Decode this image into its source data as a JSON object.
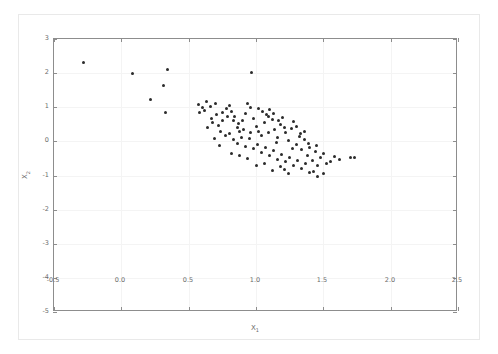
{
  "chart_data": {
    "type": "scatter",
    "title": "",
    "xlabel": "X1",
    "ylabel": "X2",
    "xlabel_base": "X",
    "xlabel_sub": "1",
    "ylabel_base": "X",
    "ylabel_sub": "2",
    "xlim": [
      -0.5,
      2.5
    ],
    "ylim": [
      -5,
      3
    ],
    "xticks": [
      -0.5,
      0.0,
      0.5,
      1.0,
      1.5,
      2.0,
      2.5
    ],
    "xticklabels": [
      "-0.5",
      "0.0",
      "0.5",
      "1.0",
      "1.5",
      "2.0",
      "2.5"
    ],
    "yticks": [
      -5,
      -4,
      -3,
      -2,
      -1,
      0,
      1,
      2,
      3
    ],
    "yticklabels": [
      "-5",
      "-4",
      "-3",
      "-2",
      "-1",
      "0",
      "1",
      "2",
      "3"
    ],
    "grid": true,
    "legend": null,
    "marker": "circle",
    "marker_color": "#2b2b2b",
    "marker_size": 3,
    "n_points": 118,
    "points": [
      [
        -0.28,
        2.3
      ],
      [
        0.08,
        1.99
      ],
      [
        0.34,
        2.11
      ],
      [
        0.31,
        1.64
      ],
      [
        0.22,
        1.22
      ],
      [
        0.33,
        0.86
      ],
      [
        0.97,
        2.03
      ],
      [
        0.63,
        1.16
      ],
      [
        0.57,
        1.07
      ],
      [
        0.6,
        0.99
      ],
      [
        0.62,
        0.9
      ],
      [
        0.58,
        0.84
      ],
      [
        0.66,
        1.02
      ],
      [
        0.7,
        1.12
      ],
      [
        0.68,
        0.55
      ],
      [
        0.72,
        0.47
      ],
      [
        0.75,
        0.62
      ],
      [
        0.78,
        0.95
      ],
      [
        0.8,
        1.05
      ],
      [
        0.82,
        0.88
      ],
      [
        0.84,
        0.72
      ],
      [
        0.86,
        0.4
      ],
      [
        0.88,
        0.28
      ],
      [
        0.9,
        0.6
      ],
      [
        0.92,
        0.82
      ],
      [
        0.94,
        1.12
      ],
      [
        0.96,
        0.98
      ],
      [
        0.98,
        0.66
      ],
      [
        1.0,
        0.45
      ],
      [
        1.02,
        0.3
      ],
      [
        1.04,
        0.18
      ],
      [
        1.06,
        0.55
      ],
      [
        1.08,
        0.78
      ],
      [
        1.1,
        0.92
      ],
      [
        1.12,
        0.63
      ],
      [
        1.14,
        0.35
      ],
      [
        1.16,
        0.1
      ],
      [
        1.18,
        0.48
      ],
      [
        1.2,
        0.7
      ],
      [
        1.22,
        0.25
      ],
      [
        1.24,
        0.02
      ],
      [
        1.26,
        0.38
      ],
      [
        1.28,
        0.58
      ],
      [
        1.3,
        -0.1
      ],
      [
        1.32,
        0.15
      ],
      [
        1.34,
        -0.25
      ],
      [
        1.36,
        0.05
      ],
      [
        1.38,
        -0.4
      ],
      [
        1.4,
        -0.18
      ],
      [
        1.42,
        -0.55
      ],
      [
        1.44,
        -0.3
      ],
      [
        1.46,
        -0.72
      ],
      [
        1.48,
        -0.48
      ],
      [
        1.5,
        -0.95
      ],
      [
        1.52,
        -0.66
      ],
      [
        1.46,
        -1.02
      ],
      [
        1.43,
        -0.88
      ],
      [
        1.55,
        -0.58
      ],
      [
        1.58,
        -0.45
      ],
      [
        1.62,
        -0.52
      ],
      [
        1.7,
        -0.48
      ],
      [
        1.73,
        -0.47
      ],
      [
        0.74,
        0.3
      ],
      [
        0.77,
        0.18
      ],
      [
        0.8,
        0.22
      ],
      [
        0.83,
        0.05
      ],
      [
        0.86,
        -0.05
      ],
      [
        0.89,
        0.12
      ],
      [
        0.92,
        -0.15
      ],
      [
        0.95,
        0.08
      ],
      [
        0.98,
        -0.22
      ],
      [
        1.01,
        -0.08
      ],
      [
        1.04,
        -0.32
      ],
      [
        1.07,
        -0.18
      ],
      [
        1.1,
        -0.42
      ],
      [
        1.13,
        -0.28
      ],
      [
        1.16,
        -0.52
      ],
      [
        1.19,
        -0.38
      ],
      [
        1.22,
        -0.6
      ],
      [
        1.25,
        -0.46
      ],
      [
        1.28,
        -0.7
      ],
      [
        1.31,
        -0.56
      ],
      [
        1.34,
        -0.8
      ],
      [
        1.37,
        -0.64
      ],
      [
        1.4,
        -0.9
      ],
      [
        1.24,
        -0.95
      ],
      [
        1.21,
        -0.82
      ],
      [
        1.18,
        -0.74
      ],
      [
        1.12,
        -0.86
      ],
      [
        1.06,
        -0.64
      ],
      [
        1.0,
        -0.72
      ],
      [
        0.94,
        -0.5
      ],
      [
        0.88,
        -0.42
      ],
      [
        0.82,
        -0.35
      ],
      [
        0.91,
        0.35
      ],
      [
        0.87,
        0.52
      ],
      [
        0.83,
        0.62
      ],
      [
        0.79,
        0.72
      ],
      [
        0.75,
        0.85
      ],
      [
        0.71,
        0.78
      ],
      [
        0.67,
        0.68
      ],
      [
        0.64,
        0.42
      ],
      [
        1.05,
        0.88
      ],
      [
        1.09,
        0.72
      ],
      [
        1.13,
        0.82
      ],
      [
        1.17,
        0.6
      ],
      [
        1.21,
        0.42
      ],
      [
        1.09,
        0.25
      ],
      [
        1.15,
        -0.02
      ],
      [
        1.27,
        -0.2
      ],
      [
        1.33,
        0.22
      ],
      [
        1.39,
        -0.05
      ],
      [
        1.45,
        -0.12
      ],
      [
        0.69,
        0.08
      ],
      [
        0.73,
        -0.12
      ],
      [
        0.96,
        0.25
      ],
      [
        1.02,
        0.95
      ],
      [
        1.3,
        0.45
      ],
      [
        1.36,
        0.3
      ],
      [
        1.5,
        -0.35
      ]
    ]
  }
}
